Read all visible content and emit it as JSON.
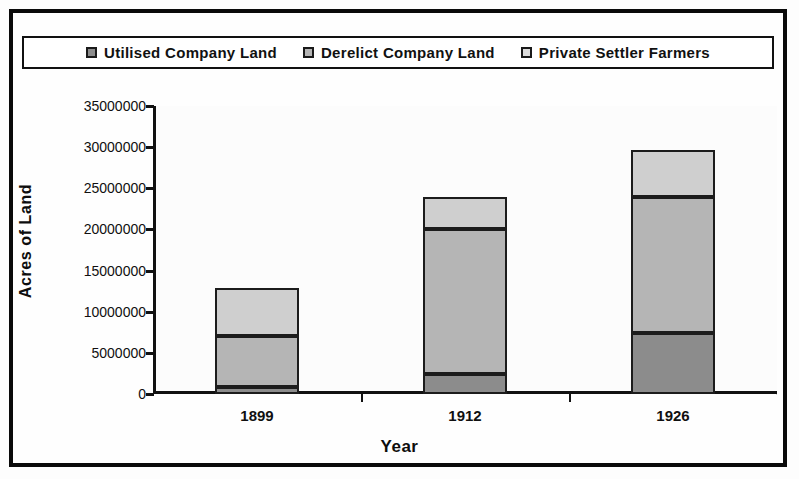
{
  "chart_data": {
    "type": "bar",
    "stacked": true,
    "title": "",
    "xlabel": "Year",
    "ylabel": "Acres of Land",
    "categories": [
      "1899",
      "1912",
      "1926"
    ],
    "ylim": [
      0,
      35000000
    ],
    "yticks": [
      0,
      5000000,
      10000000,
      15000000,
      20000000,
      25000000,
      30000000,
      35000000
    ],
    "ytick_labels": [
      "0",
      "5000000",
      "10000000",
      "15000000",
      "20000000",
      "25000000",
      "30000000",
      "35000000"
    ],
    "grid": false,
    "legend_position": "top",
    "series": [
      {
        "name": "Utilised Company Land",
        "color": "#8c8c8c",
        "values": [
          900000,
          2400000,
          7400000
        ]
      },
      {
        "name": "Derelict Company Land",
        "color": "#b5b5b5",
        "values": [
          6200000,
          17600000,
          16500000
        ]
      },
      {
        "name": "Private Settler Farmers",
        "color": "#cfcfcf",
        "values": [
          5800000,
          3900000,
          5800000
        ]
      }
    ],
    "totals": [
      12900000,
      23900000,
      29700000
    ],
    "annotations": []
  },
  "legend": {
    "items": [
      {
        "label": "Utilised Company Land",
        "swatch": "#8c8c8c"
      },
      {
        "label": "Derelict Company Land",
        "swatch": "#b5b5b5"
      },
      {
        "label": "Private Settler Farmers",
        "swatch": "#dcdcdc"
      }
    ]
  },
  "colors": {
    "frame": "#0a0a0a",
    "axis": "#111111",
    "background": "#fefefe",
    "series_1": "#8c8c8c",
    "series_2": "#b5b5b5",
    "series_3": "#cfcfcf"
  }
}
